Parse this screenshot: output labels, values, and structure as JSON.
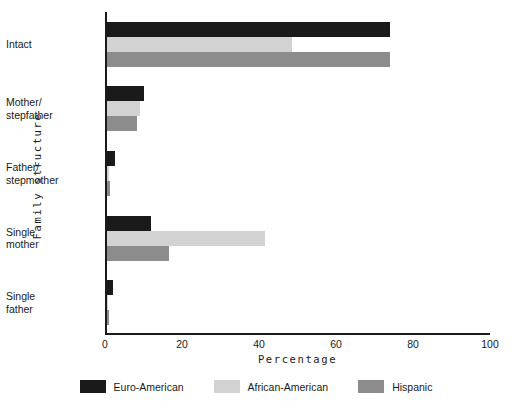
{
  "chart_data": {
    "type": "bar",
    "orientation": "horizontal",
    "title": "",
    "xlabel": "Percentage",
    "ylabel": "Family structure",
    "xlim": [
      0,
      100
    ],
    "xticks": [
      0,
      20,
      40,
      60,
      80,
      100
    ],
    "xtick_labels": [
      "0",
      "20",
      "40",
      "60",
      "80",
      "100"
    ],
    "grid": false,
    "legend_position": "bottom",
    "categories": [
      "Intact",
      "Mother/ stepfather",
      "Father/ stepmother",
      "Single mother",
      "Single father"
    ],
    "category_lines": [
      [
        "Intact"
      ],
      [
        "Mother/",
        "stepfather"
      ],
      [
        "Father/",
        "stepmother"
      ],
      [
        "Single",
        "mother"
      ],
      [
        "Single",
        "father"
      ]
    ],
    "series": [
      {
        "name": "Euro-American",
        "color": "#1a1a1a",
        "values": [
          73.5,
          9.6,
          2.0,
          11.5,
          1.5
        ]
      },
      {
        "name": "African-American",
        "color": "#d2d2d2",
        "values": [
          48.0,
          8.6,
          0.4,
          41.0,
          0.3
        ]
      },
      {
        "name": "Hispanic",
        "color": "#8c8c8c",
        "values": [
          73.5,
          7.8,
          0.8,
          16.0,
          0.5
        ]
      }
    ]
  },
  "axis": {
    "line_color": "#1a1a1a"
  }
}
